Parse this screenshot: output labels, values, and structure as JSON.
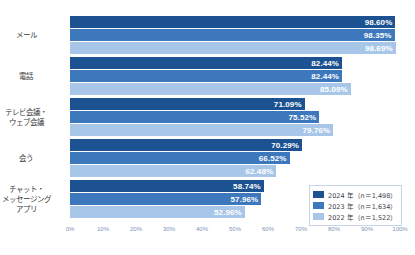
{
  "top_clipped_text": "",
  "chart_data": {
    "type": "bar",
    "orientation": "horizontal",
    "title": "",
    "xlabel": "",
    "ylabel": "",
    "xlim": [
      0,
      100
    ],
    "grid": false,
    "legend_position": "bottom-right",
    "value_suffix": "%",
    "categories": [
      "メール",
      "電話",
      "テレビ会議・\nウェブ会議",
      "会う",
      "チャット・\nメッセージング\nアプリ"
    ],
    "category_lines": [
      [
        "メール"
      ],
      [
        "電話"
      ],
      [
        "テレビ会議・",
        "ウェブ会議"
      ],
      [
        "会う"
      ],
      [
        "チャット・",
        "メッセージング",
        "アプリ"
      ]
    ],
    "tick_labels": [
      "0%",
      "10%",
      "20%",
      "30%",
      "40%",
      "50%",
      "60%",
      "70%",
      "80%",
      "90%",
      "100%"
    ],
    "tick_values": [
      0,
      10,
      20,
      30,
      40,
      50,
      60,
      70,
      80,
      90,
      100
    ],
    "series": [
      {
        "name": "2024 年（n＝1,498）",
        "color": "#1c5291",
        "values": [
          98.6,
          82.44,
          71.09,
          70.29,
          58.74
        ],
        "labels": [
          "98.60%",
          "82.44%",
          "71.09%",
          "70.29%",
          "58.74%"
        ]
      },
      {
        "name": "2023 年（n＝1,634）",
        "color": "#3d78bd",
        "values": [
          98.35,
          82.44,
          75.52,
          66.52,
          57.96
        ],
        "labels": [
          "98.35%",
          "82.44%",
          "75.52%",
          "66.52%",
          "57.96%"
        ]
      },
      {
        "name": "2022 年（n＝1,522）",
        "color": "#a8c7e8",
        "values": [
          98.69,
          85.09,
          79.76,
          62.48,
          52.96
        ],
        "labels": [
          "98.69%",
          "85.09%",
          "79.76%",
          "62.48%",
          "52.96%"
        ]
      }
    ]
  },
  "legend": {
    "items": [
      {
        "label": "2024 年（n＝1,498）",
        "color": "#1c5291"
      },
      {
        "label": "2023 年（n＝1,634）",
        "color": "#3d78bd"
      },
      {
        "label": "2022 年（n＝1,522）",
        "color": "#a8c7e8"
      }
    ]
  }
}
